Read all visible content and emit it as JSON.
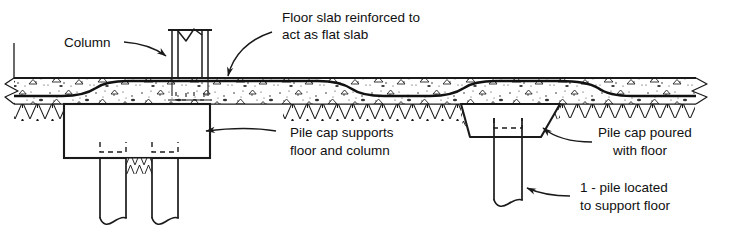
{
  "figure": {
    "type": "engineering-section-diagram",
    "background_color": "#ffffff",
    "line_color": "#101010"
  },
  "labels": {
    "column": {
      "text": "Column"
    },
    "floor_slab": {
      "line1": "Floor slab reinforced to",
      "line2": "act as flat slab"
    },
    "pile_cap_left": {
      "line1": "Pile cap supports",
      "line2": "floor and column"
    },
    "pile_cap_right": {
      "line1": "Pile cap poured",
      "line2": "with floor"
    },
    "single_pile": {
      "line1": "1 - pile located",
      "line2": "to support floor"
    }
  },
  "parts": {
    "slab": "concrete-floor-slab",
    "ground": "earth-hatching",
    "column": "steel-column",
    "pile_cap_left": "rectangular-pile-cap",
    "pile_cap_right": "trapezoidal-pile-cap",
    "piles_left": 2,
    "piles_right": 1
  }
}
